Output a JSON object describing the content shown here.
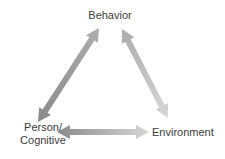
{
  "diagram": {
    "background_color": "#ffffff",
    "text_color": "#3c3c3c",
    "nodes": {
      "behavior": {
        "label": "Behavior"
      },
      "person": {
        "label_line1": "Person/",
        "label_line2": "Cognitive"
      },
      "environment": {
        "label": "Environment"
      }
    },
    "edges": [
      {
        "name": "person-behavior",
        "from": "Person/Cognitive",
        "to": "Behavior",
        "direction": "bidirectional"
      },
      {
        "name": "behavior-environment",
        "from": "Behavior",
        "to": "Environment",
        "direction": "bidirectional"
      },
      {
        "name": "person-environment",
        "from": "Person/Cognitive",
        "to": "Environment",
        "direction": "bidirectional"
      }
    ],
    "colors": {
      "arrow_dark": "#8a8a8a",
      "arrow_mid": "#adadad",
      "arrow_light": "#d6d6d6"
    }
  }
}
